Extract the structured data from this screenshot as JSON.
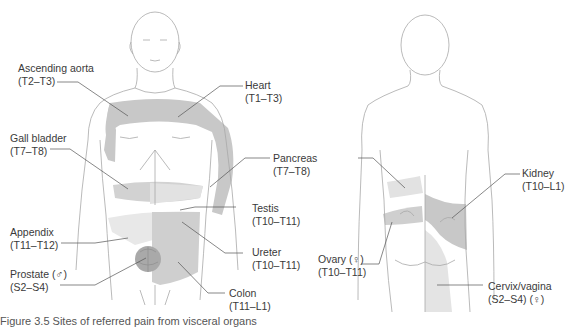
{
  "figure": {
    "views": [
      "anterior",
      "posterior"
    ],
    "colors": {
      "outline": "#a8a8a8",
      "leader_line": "#555555",
      "shade_dark": "#c8c8c8",
      "shade_mid": "#d8d8d8",
      "shade_light": "#e8e8e8",
      "prostate": "#a9a9a9",
      "text": "#3a3a3a"
    },
    "labels": {
      "ascending_aorta": {
        "name": "Ascending aorta",
        "segments": "(T2–T3)"
      },
      "heart": {
        "name": "Heart",
        "segments": "(T1–T3)"
      },
      "gall_bladder": {
        "name": "Gall bladder",
        "segments": "(T7–T8)"
      },
      "pancreas": {
        "name": "Pancreas",
        "segments": "(T7–T8)"
      },
      "testis": {
        "name": "Testis",
        "segments": "(T10–T11)"
      },
      "appendix": {
        "name": "Appendix",
        "segments": "(T11–T12)"
      },
      "ureter": {
        "name": "Ureter",
        "segments": "(T10–T11)"
      },
      "prostate": {
        "name": "Prostate (♂)",
        "segments": "(S2–S4)"
      },
      "colon": {
        "name": "Colon",
        "segments": "(T11–L1)"
      },
      "kidney": {
        "name": "Kidney",
        "segments": "(T10–L1)"
      },
      "ovary": {
        "name": "Ovary (♀)",
        "segments": "(T10–T11)"
      },
      "cervix_vagina": {
        "name": "Cervix/vagina",
        "segments": "(S2–S4) (♀)"
      }
    },
    "caption": "Figure 3.5   Sites of referred pain from visceral organs"
  }
}
